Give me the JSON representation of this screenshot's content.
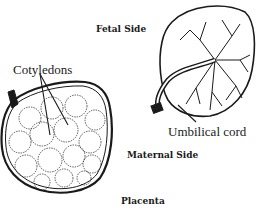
{
  "diagram": {
    "title": "Placenta",
    "labels": {
      "fetal_side": "Fetal Side",
      "maternal_side": "Maternal Side",
      "cotyledons": "Cotyledons",
      "umbilical_cord": "Umbilical cord"
    },
    "colors": {
      "ink": "#1a1a1a",
      "background": "#ffffff"
    }
  }
}
